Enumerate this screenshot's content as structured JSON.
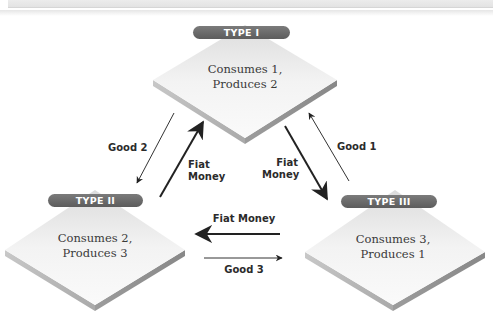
{
  "diagram": {
    "type": "exchange-flow",
    "nodes": [
      {
        "id": "type1",
        "title": "TYPE I",
        "line1": "Consumes 1,",
        "line2": "Produces 2"
      },
      {
        "id": "type2",
        "title": "TYPE II",
        "line1": "Consumes 2,",
        "line2": "Produces 3"
      },
      {
        "id": "type3",
        "title": "TYPE III",
        "line1": "Consumes 3,",
        "line2": "Produces 1"
      }
    ],
    "edges": [
      {
        "from": "type1",
        "to": "type2",
        "label": "Good 2"
      },
      {
        "from": "type2",
        "to": "type1",
        "label_line1": "Fiat",
        "label_line2": "Money"
      },
      {
        "from": "type1",
        "to": "type3",
        "label_line1": "Fiat",
        "label_line2": "Money"
      },
      {
        "from": "type3",
        "to": "type1",
        "label": "Good 1"
      },
      {
        "from": "type3",
        "to": "type2",
        "label": "Fiat Money"
      },
      {
        "from": "type2",
        "to": "type3",
        "label": "Good 3"
      }
    ],
    "colors": {
      "pill": "#666666",
      "diamond_face": "#e9e9e9",
      "diamond_edge": "#9a9a9a",
      "arrow": "#222222"
    }
  }
}
